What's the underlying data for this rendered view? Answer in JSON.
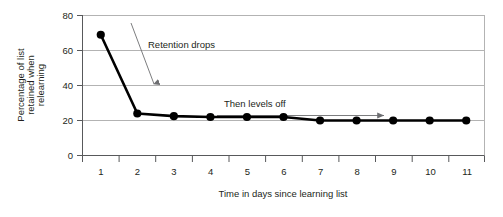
{
  "chart_data": {
    "type": "line",
    "title": "",
    "subtitle": "",
    "xlabel": "Time in days since learning list",
    "ylabel": "Percentage of list retained when relearning",
    "ylabel_lines": [
      "Percentage of list",
      "retained when",
      "relearning"
    ],
    "categories": [
      1,
      2,
      3,
      4,
      5,
      6,
      7,
      8,
      9,
      10,
      11
    ],
    "x_tick_labels": [
      "1",
      "2",
      "3",
      "4",
      "5",
      "6",
      "7",
      "8",
      "9",
      "10",
      "11"
    ],
    "values": [
      69,
      24,
      22.5,
      22,
      22,
      22,
      20,
      20,
      20,
      20,
      20
    ],
    "series": [
      {
        "name": "Percentage of list retained when relearning",
        "values": [
          69,
          24,
          22.5,
          22,
          22,
          22,
          20,
          20,
          20,
          20,
          20
        ]
      }
    ],
    "ylim": [
      0,
      80
    ],
    "y_ticks": [
      0,
      20,
      40,
      60,
      80
    ],
    "y_tick_labels": [
      "0",
      "20",
      "40",
      "60",
      "80"
    ],
    "xlim": [
      0.5,
      11.5
    ],
    "grid": "horizontal",
    "legend": "none",
    "line_color": "#000000",
    "marker": "circle",
    "marker_color": "#000000",
    "gridline_color": "#b3b3b3",
    "axis_color": "#58595b",
    "annotation_color": "#6d6e71",
    "annotations": [
      {
        "id": "retention-drops",
        "text": "Retention drops",
        "arrow": "diagonal-down-right",
        "points_to_x": 2,
        "points_to_y": 40
      },
      {
        "id": "then-levels-off",
        "text": "Then levels off",
        "arrow": "horizontal-right",
        "spans_x": [
          4,
          9
        ],
        "at_y": 26
      }
    ]
  }
}
